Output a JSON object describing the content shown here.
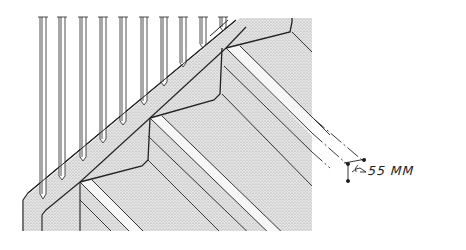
{
  "drawing": {
    "subject": "staircase with balusters and stringer, isometric view",
    "baluster_count": 10,
    "step_count_visible": 3,
    "colors": {
      "ink": "#222222",
      "fill": "#d9d9d9",
      "background": "#ffffff"
    }
  },
  "annotation": {
    "dimension_label": "55 MM"
  }
}
